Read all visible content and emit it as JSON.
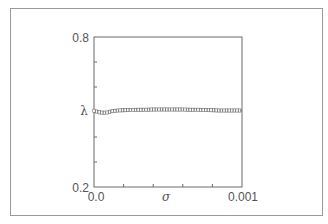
{
  "chart_data": {
    "type": "line",
    "title": "",
    "xlabel": "σ",
    "ylabel": "λ",
    "xlim": [
      0.0,
      0.001
    ],
    "ylim": [
      0.2,
      0.8
    ],
    "x_tick_labels": [
      "0.0",
      "0.001"
    ],
    "y_tick_labels": [
      "0.8",
      "0.2"
    ],
    "x_minor_ticks": 4,
    "y_minor_ticks": 5,
    "grid": false,
    "legend": null,
    "marker": "square",
    "series": [
      {
        "name": "λ(σ)",
        "x": [
          0.0,
          4e-05,
          8e-05,
          0.00012,
          0.00016,
          0.0002,
          0.00025,
          0.0003,
          0.00035,
          0.0004,
          0.00045,
          0.0005,
          0.00055,
          0.0006,
          0.00065,
          0.0007,
          0.00075,
          0.0008,
          0.00085,
          0.0009,
          0.00095,
          0.001
        ],
        "y": [
          0.505,
          0.498,
          0.497,
          0.503,
          0.506,
          0.507,
          0.508,
          0.509,
          0.509,
          0.51,
          0.51,
          0.51,
          0.51,
          0.51,
          0.509,
          0.509,
          0.508,
          0.507,
          0.506,
          0.506,
          0.506,
          0.506
        ]
      }
    ]
  },
  "labels": {
    "y_top": "0.8",
    "y_bottom": "0.2",
    "y_symbol": "λ",
    "x_left": "0.0",
    "x_right": "0.001",
    "x_symbol": "σ"
  }
}
